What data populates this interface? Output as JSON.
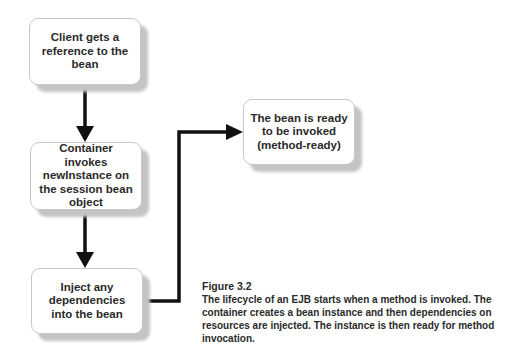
{
  "diagram": {
    "type": "flowchart",
    "nodes": [
      {
        "id": "box1",
        "label": "Client gets a reference to the bean"
      },
      {
        "id": "box2",
        "label": "Container invokes newInstance on the session bean object"
      },
      {
        "id": "box3",
        "label": "Inject any dependencies into the bean"
      },
      {
        "id": "box4",
        "label": "The bean is ready to be invoked (method-ready)"
      }
    ],
    "edges": [
      {
        "from": "box1",
        "to": "box2"
      },
      {
        "from": "box2",
        "to": "box3"
      },
      {
        "from": "box3",
        "to": "box4"
      }
    ],
    "colors": {
      "line": "#111111",
      "box_border": "#c8c8c8",
      "shadow": "#c4c4c4",
      "text": "#2a2a2a"
    }
  },
  "caption": {
    "figure_label": "Figure 3.2",
    "text": "The lifecycle of an EJB starts when a method is invoked. The container creates a bean instance and then dependencies on resources are injected. The instance is then ready for method invocation."
  }
}
